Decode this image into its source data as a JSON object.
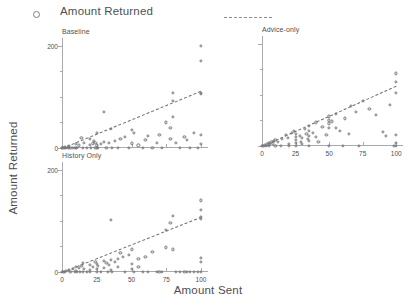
{
  "legend": {
    "marker_label": "Amount Returned",
    "marker_icon": "open-circle-marker",
    "line_icon": "dashed-fit-line",
    "marker_color": "#7d7e82",
    "line_color": "#8d8e92"
  },
  "axes": {
    "x_title": "Amount Sent",
    "y_title": "Amount Returned"
  },
  "chart_data": {
    "type": "scatter",
    "title": "Amount Returned",
    "xlabel": "Amount Sent",
    "ylabel": "Amount Returned",
    "grid": false,
    "legend_position": "top",
    "xlim": [
      0,
      105
    ],
    "ylim": [
      0,
      215
    ],
    "xticks": [
      0,
      25,
      50,
      75,
      100
    ],
    "xticklabels": [
      "0",
      "25",
      "50",
      "75",
      "100"
    ],
    "yticks": [
      0,
      200
    ],
    "yticklabels": [
      "0",
      "200"
    ],
    "y_minor_ticks": [
      50,
      100,
      150
    ],
    "marker": "open-circle",
    "fit_line_style": "dashed",
    "panels": [
      {
        "name": "baseline",
        "title": "Baseline",
        "show_x_ticklabels": false,
        "show_y_ticklabels": true,
        "fit": {
          "intercept": 0,
          "slope": 1.12
        },
        "points": [
          [
            0,
            0
          ],
          [
            0,
            0
          ],
          [
            1,
            0
          ],
          [
            2,
            0
          ],
          [
            2,
            2
          ],
          [
            3,
            0
          ],
          [
            4,
            0
          ],
          [
            5,
            4
          ],
          [
            5,
            0
          ],
          [
            6,
            0
          ],
          [
            8,
            0
          ],
          [
            9,
            0
          ],
          [
            10,
            8
          ],
          [
            10,
            0
          ],
          [
            11,
            0
          ],
          [
            12,
            5
          ],
          [
            14,
            20
          ],
          [
            15,
            0
          ],
          [
            16,
            10
          ],
          [
            18,
            0
          ],
          [
            20,
            18
          ],
          [
            20,
            6
          ],
          [
            21,
            0
          ],
          [
            22,
            9
          ],
          [
            23,
            14
          ],
          [
            24,
            10
          ],
          [
            24,
            0
          ],
          [
            25,
            30
          ],
          [
            25,
            5
          ],
          [
            25,
            0
          ],
          [
            26,
            0
          ],
          [
            28,
            8
          ],
          [
            30,
            70
          ],
          [
            30,
            12
          ],
          [
            32,
            0
          ],
          [
            34,
            10
          ],
          [
            35,
            38
          ],
          [
            36,
            0
          ],
          [
            38,
            14
          ],
          [
            40,
            0
          ],
          [
            42,
            18
          ],
          [
            45,
            22
          ],
          [
            48,
            0
          ],
          [
            50,
            36
          ],
          [
            50,
            9
          ],
          [
            52,
            30
          ],
          [
            55,
            5
          ],
          [
            58,
            0
          ],
          [
            60,
            16
          ],
          [
            62,
            24
          ],
          [
            65,
            0
          ],
          [
            68,
            10
          ],
          [
            70,
            26
          ],
          [
            72,
            0
          ],
          [
            75,
            50
          ],
          [
            78,
            40
          ],
          [
            78,
            18
          ],
          [
            80,
            108
          ],
          [
            80,
            92
          ],
          [
            80,
            60
          ],
          [
            82,
            10
          ],
          [
            85,
            0
          ],
          [
            88,
            22
          ],
          [
            90,
            16
          ],
          [
            92,
            0
          ],
          [
            95,
            30
          ],
          [
            98,
            0
          ],
          [
            100,
            200
          ],
          [
            100,
            170
          ],
          [
            100,
            108
          ],
          [
            100,
            105
          ],
          [
            100,
            26
          ],
          [
            100,
            8
          ]
        ]
      },
      {
        "name": "advice-only",
        "title": "Advice-only",
        "show_x_ticklabels": true,
        "show_y_ticklabels": false,
        "fit": {
          "intercept": 0,
          "slope": 1.18
        },
        "points": [
          [
            0,
            0
          ],
          [
            1,
            0
          ],
          [
            2,
            2
          ],
          [
            3,
            0
          ],
          [
            4,
            3
          ],
          [
            5,
            6
          ],
          [
            5,
            0
          ],
          [
            6,
            4
          ],
          [
            7,
            8
          ],
          [
            8,
            5
          ],
          [
            9,
            10
          ],
          [
            10,
            12
          ],
          [
            10,
            0
          ],
          [
            12,
            8
          ],
          [
            14,
            0
          ],
          [
            15,
            14
          ],
          [
            18,
            22
          ],
          [
            19,
            16
          ],
          [
            20,
            4
          ],
          [
            20,
            0
          ],
          [
            22,
            26
          ],
          [
            24,
            30
          ],
          [
            25,
            24
          ],
          [
            25,
            18
          ],
          [
            25,
            12
          ],
          [
            25,
            6
          ],
          [
            25,
            0
          ],
          [
            28,
            20
          ],
          [
            29,
            8
          ],
          [
            30,
            16
          ],
          [
            30,
            4
          ],
          [
            32,
            34
          ],
          [
            33,
            24
          ],
          [
            34,
            14
          ],
          [
            35,
            40
          ],
          [
            35,
            30
          ],
          [
            35,
            20
          ],
          [
            35,
            10
          ],
          [
            35,
            0
          ],
          [
            38,
            26
          ],
          [
            40,
            46
          ],
          [
            40,
            18
          ],
          [
            42,
            8
          ],
          [
            45,
            38
          ],
          [
            48,
            22
          ],
          [
            50,
            58
          ],
          [
            50,
            50
          ],
          [
            50,
            44
          ],
          [
            50,
            36
          ],
          [
            50,
            0
          ],
          [
            52,
            48
          ],
          [
            55,
            62
          ],
          [
            55,
            36
          ],
          [
            58,
            30
          ],
          [
            60,
            0
          ],
          [
            62,
            54
          ],
          [
            65,
            24
          ],
          [
            66,
            78
          ],
          [
            70,
            66
          ],
          [
            72,
            0
          ],
          [
            75,
            88
          ],
          [
            80,
            72
          ],
          [
            85,
            60
          ],
          [
            90,
            28
          ],
          [
            92,
            20
          ],
          [
            95,
            80
          ],
          [
            98,
            0
          ],
          [
            100,
            142
          ],
          [
            100,
            126
          ],
          [
            100,
            104
          ],
          [
            100,
            22
          ],
          [
            100,
            6
          ],
          [
            100,
            0
          ]
        ]
      },
      {
        "name": "history-only",
        "title": "History Only",
        "show_x_ticklabels": true,
        "show_y_ticklabels": true,
        "fit": {
          "intercept": 0,
          "slope": 1.08
        },
        "points": [
          [
            0,
            0
          ],
          [
            1,
            0
          ],
          [
            2,
            0
          ],
          [
            3,
            2
          ],
          [
            5,
            4
          ],
          [
            6,
            0
          ],
          [
            8,
            6
          ],
          [
            9,
            0
          ],
          [
            10,
            10
          ],
          [
            10,
            2
          ],
          [
            11,
            0
          ],
          [
            12,
            8
          ],
          [
            13,
            0
          ],
          [
            14,
            12
          ],
          [
            15,
            18
          ],
          [
            15,
            0
          ],
          [
            16,
            6
          ],
          [
            18,
            0
          ],
          [
            20,
            14
          ],
          [
            20,
            4
          ],
          [
            20,
            0
          ],
          [
            22,
            10
          ],
          [
            24,
            20
          ],
          [
            25,
            16
          ],
          [
            25,
            6
          ],
          [
            25,
            0
          ],
          [
            26,
            12
          ],
          [
            28,
            0
          ],
          [
            30,
            22
          ],
          [
            30,
            8
          ],
          [
            32,
            18
          ],
          [
            33,
            0
          ],
          [
            34,
            14
          ],
          [
            35,
            102
          ],
          [
            35,
            24
          ],
          [
            35,
            4
          ],
          [
            36,
            0
          ],
          [
            38,
            20
          ],
          [
            40,
            26
          ],
          [
            40,
            10
          ],
          [
            42,
            38
          ],
          [
            44,
            30
          ],
          [
            45,
            0
          ],
          [
            48,
            34
          ],
          [
            50,
            44
          ],
          [
            50,
            16
          ],
          [
            50,
            6
          ],
          [
            52,
            0
          ],
          [
            55,
            26
          ],
          [
            55,
            10
          ],
          [
            58,
            0
          ],
          [
            60,
            30
          ],
          [
            62,
            0
          ],
          [
            65,
            40
          ],
          [
            68,
            0
          ],
          [
            70,
            0
          ],
          [
            72,
            0
          ],
          [
            75,
            82
          ],
          [
            75,
            48
          ],
          [
            78,
            96
          ],
          [
            80,
            110
          ],
          [
            80,
            44
          ],
          [
            82,
            0
          ],
          [
            85,
            0
          ],
          [
            88,
            0
          ],
          [
            90,
            0
          ],
          [
            92,
            0
          ],
          [
            95,
            0
          ],
          [
            98,
            0
          ],
          [
            100,
            140
          ],
          [
            100,
            122
          ],
          [
            100,
            108
          ],
          [
            100,
            104
          ],
          [
            100,
            28
          ],
          [
            100,
            20
          ],
          [
            100,
            0
          ]
        ]
      }
    ]
  }
}
